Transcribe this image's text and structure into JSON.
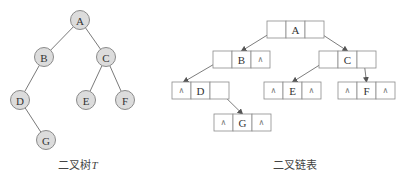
{
  "tree": {
    "caption": "二叉树",
    "caption_var": "T",
    "nodes": [
      {
        "id": "A",
        "x": 80,
        "y": 20
      },
      {
        "id": "B",
        "x": 44,
        "y": 57
      },
      {
        "id": "C",
        "x": 106,
        "y": 57
      },
      {
        "id": "D",
        "x": 20,
        "y": 100
      },
      {
        "id": "E",
        "x": 86,
        "y": 100
      },
      {
        "id": "F",
        "x": 125,
        "y": 100
      },
      {
        "id": "G",
        "x": 46,
        "y": 140
      }
    ],
    "edges": [
      [
        "A",
        "B"
      ],
      [
        "A",
        "C"
      ],
      [
        "B",
        "D"
      ],
      [
        "C",
        "E"
      ],
      [
        "C",
        "F"
      ],
      [
        "D",
        "G"
      ]
    ]
  },
  "linked": {
    "caption": "二叉链表",
    "null_symbol": "∧",
    "nodes": [
      {
        "id": "A",
        "x": 267,
        "y": 21,
        "left": "ptr",
        "right": "ptr"
      },
      {
        "id": "B",
        "x": 213,
        "y": 51,
        "left": "ptr",
        "right": "null"
      },
      {
        "id": "C",
        "x": 319,
        "y": 51,
        "left": "ptr",
        "right": "ptr"
      },
      {
        "id": "D",
        "x": 172,
        "y": 82,
        "left": "null",
        "right": "ptr"
      },
      {
        "id": "E",
        "x": 264,
        "y": 82,
        "left": "null",
        "right": "null"
      },
      {
        "id": "F",
        "x": 338,
        "y": 82,
        "left": "null",
        "right": "null"
      },
      {
        "id": "G",
        "x": 214,
        "y": 114,
        "left": "null",
        "right": "null"
      }
    ],
    "pointers": [
      {
        "from": "A",
        "side": "left",
        "to": "B"
      },
      {
        "from": "A",
        "side": "right",
        "to": "C"
      },
      {
        "from": "B",
        "side": "left",
        "to": "D"
      },
      {
        "from": "C",
        "side": "left",
        "to": "E"
      },
      {
        "from": "C",
        "side": "right",
        "to": "F"
      },
      {
        "from": "D",
        "side": "right",
        "to": "G"
      }
    ]
  },
  "colors": {
    "node_fill": "#dcdcdc",
    "stroke": "#8a8a8a"
  }
}
